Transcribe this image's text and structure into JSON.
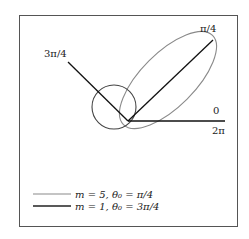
{
  "diagram": {
    "type": "polar-radiation-pattern",
    "labels": {
      "angle_3pi4": "3π/4",
      "angle_pi4": "π/4",
      "angle_0": "0",
      "angle_2pi": "2π"
    },
    "legend": [
      {
        "text": "m = 5, θ₀ = π/4",
        "color": "#888888"
      },
      {
        "text": "m = 1, θ₀ = 3π/4",
        "color": "#222222"
      }
    ],
    "colors": {
      "frame": "#555555",
      "axes": "#111111",
      "lobe_m5": "#888888",
      "lobe_m1": "#444444"
    }
  }
}
